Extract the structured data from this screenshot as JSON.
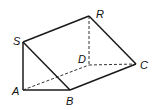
{
  "figure": {
    "type": "triangular-prism",
    "vertices": {
      "S": {
        "label": "S",
        "x": 23,
        "y": 42
      },
      "A": {
        "label": "A",
        "x": 23,
        "y": 90
      },
      "B": {
        "label": "B",
        "x": 70,
        "y": 90
      },
      "R": {
        "label": "R",
        "x": 89,
        "y": 16
      },
      "D": {
        "label": "D",
        "x": 89,
        "y": 65
      },
      "C": {
        "label": "C",
        "x": 136,
        "y": 64
      }
    },
    "solid_edges": [
      "SA",
      "AB",
      "SB",
      "SR",
      "BC",
      "RC"
    ],
    "hidden_edges": [
      "AD",
      "RD",
      "DC"
    ],
    "colors": {
      "stroke": "#1a1a1a",
      "background": "#ffffff"
    }
  }
}
